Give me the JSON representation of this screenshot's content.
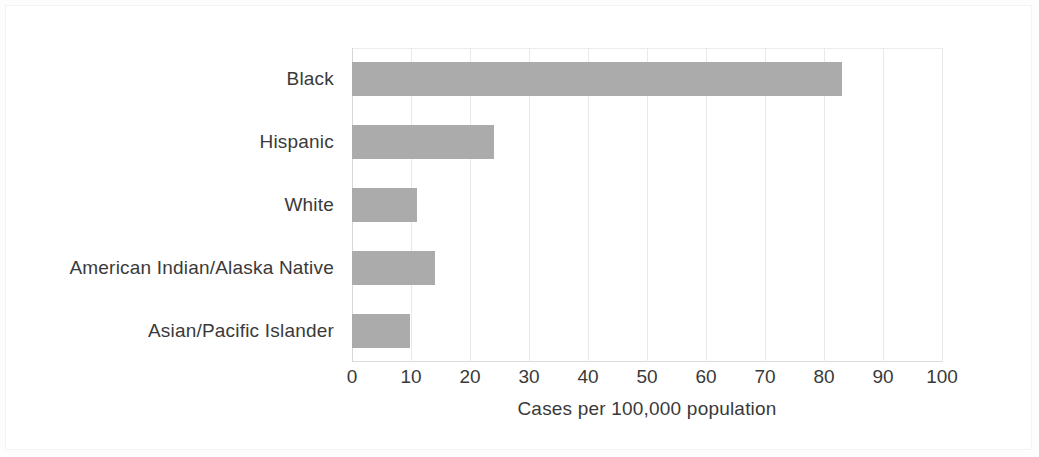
{
  "chart_data": {
    "type": "bar",
    "orientation": "horizontal",
    "title": "",
    "subtitle": "",
    "xlabel": "Cases per 100,000 population",
    "ylabel": "",
    "categories": [
      "Black",
      "Hispanic",
      "White",
      "American Indian/Alaska Native",
      "Asian/Pacific Islander"
    ],
    "values": [
      83,
      24,
      11,
      14,
      9.8
    ],
    "xlim": [
      0,
      100
    ],
    "xticks": [
      0,
      10,
      20,
      30,
      40,
      50,
      60,
      70,
      80,
      90,
      100
    ],
    "xtick_labels": [
      "0",
      "10",
      "20",
      "30",
      "40",
      "50",
      "60",
      "70",
      "80",
      "90",
      "100"
    ],
    "grid": true,
    "grid_axis": "x",
    "legend": false,
    "legend_position": "none",
    "bar_color": "#ababab",
    "grid_color": "#e9e9e9",
    "text_color": "#3a3a3a",
    "background_color": "#ffffff"
  },
  "figure": {
    "name": "bar-chart-cases-per-100000-by-race-ethnicity"
  }
}
